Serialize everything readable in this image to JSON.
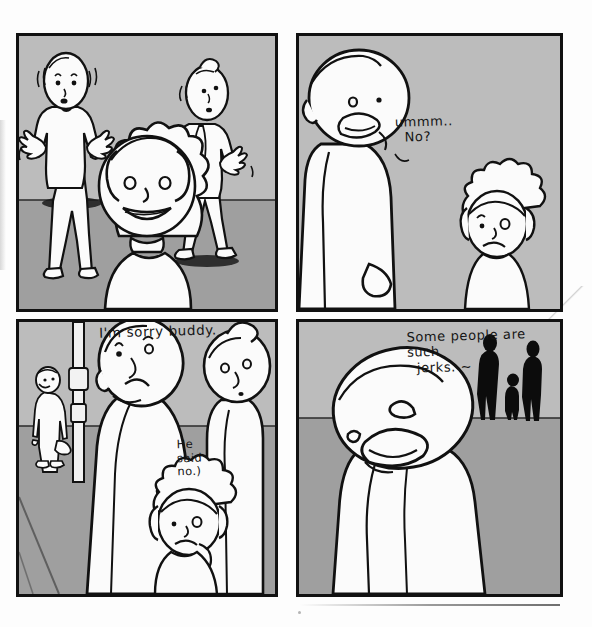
{
  "comic": {
    "medium": "hand-drawn ink comic on paper",
    "page_background": "#fdfdfd",
    "ink_color": "#111111",
    "wall_color": "#bcbcbc",
    "floor_color": "#9f9f9f",
    "silhouette_color": "#0c0c0c",
    "panel_count": 4,
    "panels": [
      {
        "id": "panel-1",
        "position": "top-left",
        "description": "Two adults recoil with raised hands while a smiling child stands in the foreground",
        "horizon_ratio": 0.6,
        "dialogue": [],
        "figures": [
          {
            "name": "startled-adult-left",
            "kind": "adult",
            "pose": "hands-up-backing-away"
          },
          {
            "name": "startled-adult-right",
            "kind": "adult",
            "pose": "hands-up-turning-away"
          },
          {
            "name": "smiling-child-foreground",
            "kind": "child",
            "pose": "facing-viewer-smiling"
          }
        ]
      },
      {
        "id": "panel-2",
        "position": "top-right",
        "description": "A large adult leaning down answers the small child",
        "horizon_ratio": 0.0,
        "dialogue": [
          {
            "name": "speech-ummm-no",
            "lines": [
              "ummm..",
              "  No?"
            ],
            "text": "ummm..\n  No?",
            "speaker": "adult"
          }
        ],
        "figures": [
          {
            "name": "refusing-adult",
            "kind": "adult",
            "pose": "leaning-down-frowning"
          },
          {
            "name": "sad-child",
            "kind": "child",
            "pose": "looking-up-sad"
          }
        ]
      },
      {
        "id": "panel-3",
        "position": "bottom-left",
        "description": "A parent apologises to the child while a woman looks on and a stranger waits by a pole",
        "horizon_ratio": 0.38,
        "dialogue": [
          {
            "name": "speech-im-sorry-buddy",
            "lines": [
              "I'm sorry buddy."
            ],
            "text": "I'm sorry buddy.",
            "speaker": "parent"
          },
          {
            "name": "speech-he-said-no",
            "lines": [
              "He",
              "said",
              "no.)"
            ],
            "text": "He\nsaid\nno.)",
            "speaker": "parent"
          }
        ],
        "figures": [
          {
            "name": "background-man-with-bag",
            "kind": "adult",
            "pose": "standing-holding-bag"
          },
          {
            "name": "street-pole",
            "kind": "prop",
            "pose": "vertical-post"
          },
          {
            "name": "apologising-parent",
            "kind": "adult",
            "pose": "head-tilted-sad"
          },
          {
            "name": "woman-with-bun",
            "kind": "adult",
            "pose": "standing-right-edge"
          },
          {
            "name": "sad-child",
            "kind": "child",
            "pose": "looking-up-sad"
          }
        ]
      },
      {
        "id": "panel-4",
        "position": "bottom-right",
        "description": "Close-up of the glum adult while three silhouetted passers-by walk off in the distance",
        "horizon_ratio": 0.35,
        "dialogue": [
          {
            "name": "speech-some-people-are-such-jerks",
            "lines": [
              "Some people are",
              "such",
              "  jerks. ~"
            ],
            "text": "Some people are\nsuch\n  jerks. ~",
            "speaker": "adult"
          }
        ],
        "figures": [
          {
            "name": "glum-adult-closeup",
            "kind": "adult",
            "pose": "head-tilted-grimacing"
          },
          {
            "name": "silhouette-adult-left",
            "kind": "silhouette",
            "pose": "walking-away"
          },
          {
            "name": "silhouette-child",
            "kind": "silhouette",
            "pose": "walking-away"
          },
          {
            "name": "silhouette-adult-right",
            "kind": "silhouette",
            "pose": "walking-away"
          }
        ]
      }
    ]
  }
}
